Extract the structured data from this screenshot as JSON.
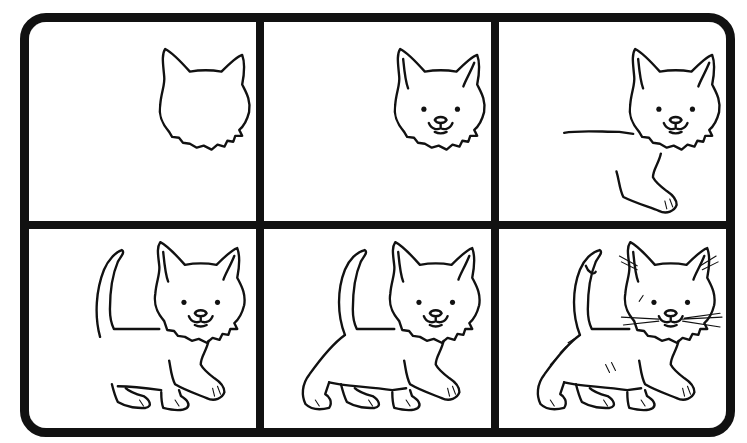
{
  "colors": {
    "ink": "#111111",
    "paper": "#ffffff"
  },
  "panels": [
    {
      "step": 1,
      "label": "Head outline with ears and fluffy cheeks",
      "parts": [
        "head"
      ]
    },
    {
      "step": 2,
      "label": "Add inner ears, eyes, nose and mouth",
      "parts": [
        "head",
        "face"
      ]
    },
    {
      "step": 3,
      "label": "Add back line and front leg",
      "parts": [
        "head",
        "face",
        "back",
        "front-leg"
      ]
    },
    {
      "step": 4,
      "label": "Add tail, chest and hind legs",
      "parts": [
        "head",
        "face",
        "back",
        "front-leg",
        "tail",
        "legs"
      ]
    },
    {
      "step": 5,
      "label": "Complete body outline and belly",
      "parts": [
        "head",
        "face",
        "back",
        "front-leg",
        "tail",
        "legs",
        "body"
      ]
    },
    {
      "step": 6,
      "label": "Add whiskers, fur details and tail tip",
      "parts": [
        "head",
        "face",
        "back",
        "front-leg",
        "tail",
        "legs",
        "body",
        "details"
      ]
    }
  ]
}
